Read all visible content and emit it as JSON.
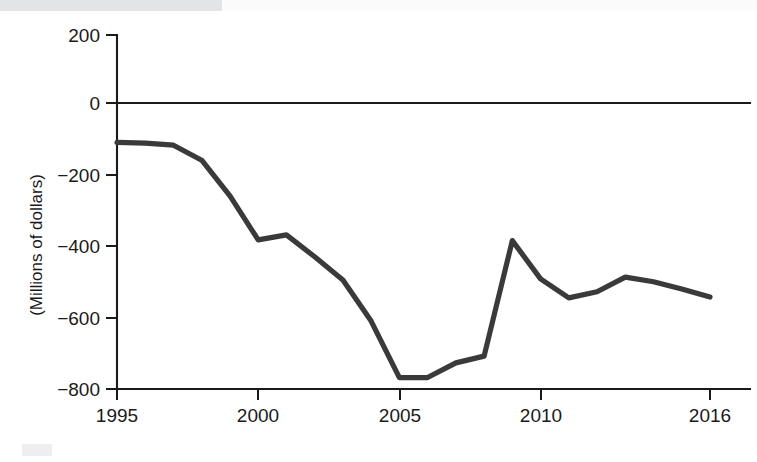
{
  "chart_data": {
    "type": "line",
    "title": "",
    "subtitle": "",
    "xlabel": "",
    "ylabel": "(Millions of dollars)",
    "xlim": [
      1995,
      2016
    ],
    "ylim": [
      -800,
      200
    ],
    "grid": false,
    "legend": null,
    "y_ticks": [
      200,
      0,
      -200,
      -400,
      -600,
      -800
    ],
    "y_tick_labels": [
      "200",
      "0",
      "−200",
      "−400",
      "−600",
      "−800"
    ],
    "x_ticks": [
      1995,
      2000,
      2005,
      2010,
      2016
    ],
    "x_tick_labels": [
      "1995",
      "2000",
      "2005",
      "2010",
      "2016"
    ],
    "zero_line": true,
    "line_color": "#3a3a3a",
    "axis_color": "#1a1a1a",
    "x": [
      1995,
      1996,
      1997,
      1998,
      1999,
      2000,
      2001,
      2002,
      2003,
      2004,
      2005,
      2006,
      2007,
      2008,
      2009,
      2010,
      2011,
      2012,
      2013,
      2014,
      2015,
      2016
    ],
    "series": [
      {
        "name": "Balance",
        "values": [
          -110,
          -112,
          -118,
          -160,
          -260,
          -383,
          -369,
          -430,
          -495,
          -610,
          -768,
          -768,
          -727,
          -708,
          -385,
          -492,
          -545,
          -528,
          -487,
          -500,
          -520,
          -543
        ]
      }
    ]
  },
  "page": {
    "background_color": "#ffffff",
    "top_band_color": "#e3e4e6"
  }
}
